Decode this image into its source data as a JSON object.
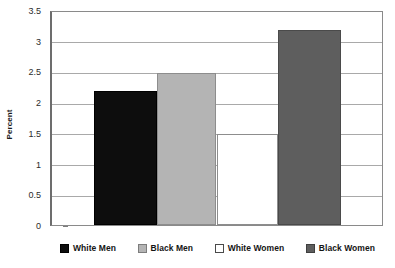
{
  "chart_data": {
    "type": "bar",
    "title": "",
    "subtitle": "",
    "xlabel": "",
    "ylabel": "Percent",
    "ylim": [
      0,
      3.5
    ],
    "y_ticks": [
      0,
      0.5,
      1,
      1.5,
      2,
      2.5,
      3,
      3.5
    ],
    "y_tick_labels": [
      "0",
      "0.5",
      "1",
      "1.5",
      "2",
      "2.5",
      "3",
      "3.5"
    ],
    "grid": true,
    "grid_axis": "y",
    "legend_position": "bottom",
    "categories": [
      "White Men",
      "Black Men",
      "White Women",
      "Black Women"
    ],
    "values": [
      2.2,
      2.5,
      1.5,
      3.2
    ],
    "series": [
      {
        "name": "Percent",
        "values": [
          2.2,
          2.5,
          1.5,
          3.2
        ]
      }
    ],
    "bar_colors": [
      "#0d0d0d",
      "#b4b4b4",
      "#ffffff",
      "#5e5e5e"
    ],
    "annotations": []
  },
  "axes": {
    "y_title": "Percent",
    "y_ticks": [
      {
        "label": "3.5",
        "value": 3.5
      },
      {
        "label": "3",
        "value": 3.0
      },
      {
        "label": "2.5",
        "value": 2.5
      },
      {
        "label": "2",
        "value": 2.0
      },
      {
        "label": "1.5",
        "value": 1.5
      },
      {
        "label": "1",
        "value": 1.0
      },
      {
        "label": "0.5",
        "value": 0.5
      },
      {
        "label": "0",
        "value": 0.0
      }
    ]
  },
  "legend": {
    "entries": [
      {
        "label": "White Men",
        "swatch": "black-swatch",
        "color": "#0d0d0d"
      },
      {
        "label": "Black Men",
        "swatch": "light-gray-swatch",
        "color": "#b4b4b4"
      },
      {
        "label": "White Women",
        "swatch": "white-swatch",
        "color": "#ffffff"
      },
      {
        "label": "Black Women",
        "swatch": "dark-gray-swatch",
        "color": "#5e5e5e"
      }
    ]
  },
  "bars": [
    {
      "label": "White Men",
      "value": 2.2,
      "swatch": "black-swatch"
    },
    {
      "label": "Black Men",
      "value": 2.5,
      "swatch": "light-gray-swatch"
    },
    {
      "label": "White Women",
      "value": 1.5,
      "swatch": "white-swatch"
    },
    {
      "label": "Black Women",
      "value": 3.2,
      "swatch": "dark-gray-swatch"
    }
  ]
}
